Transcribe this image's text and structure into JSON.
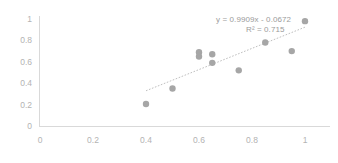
{
  "chart_data": {
    "type": "scatter",
    "title": "",
    "xlabel": "",
    "ylabel": "",
    "xlim": [
      0,
      1
    ],
    "ylim": [
      0,
      1
    ],
    "grid": false,
    "legend": false,
    "x_ticks": [
      "0",
      "0.2",
      "0.4",
      "0.6",
      "0.8",
      "1"
    ],
    "x_tick_values": [
      0,
      0.2,
      0.4,
      0.6,
      0.8,
      1
    ],
    "y_ticks": [
      "0",
      "0.2",
      "0.4",
      "0.6",
      "0.8",
      "1"
    ],
    "y_tick_values": [
      0,
      0.2,
      0.4,
      0.6,
      0.8,
      1
    ],
    "series": [
      {
        "name": "data",
        "marker": "circle",
        "color": "#a6a6a6",
        "points": [
          {
            "x": 0.4,
            "y": 0.205
          },
          {
            "x": 0.5,
            "y": 0.35
          },
          {
            "x": 0.6,
            "y": 0.69
          },
          {
            "x": 0.6,
            "y": 0.65
          },
          {
            "x": 0.65,
            "y": 0.67
          },
          {
            "x": 0.65,
            "y": 0.59
          },
          {
            "x": 0.75,
            "y": 0.52
          },
          {
            "x": 0.85,
            "y": 0.78
          },
          {
            "x": 0.95,
            "y": 0.7
          },
          {
            "x": 1.0,
            "y": 0.98
          }
        ]
      }
    ],
    "trendline": {
      "type": "linear",
      "slope": 0.9909,
      "intercept": -0.0672,
      "r_squared": 0.715,
      "color": "#bfbfbf",
      "style": "dotted",
      "x_start": 0.4,
      "x_end": 1.0
    },
    "annotations": {
      "equation": "y = 0.9909x - 0.0672",
      "r_squared_label": "R² = 0.715"
    }
  },
  "colors": {
    "marker": "#a6a6a6",
    "trendline": "#bfbfbf",
    "axis": "#d9d9d9",
    "tick_text": "#b3b3b3",
    "annotation_text": "#9b9b9b",
    "background": "#ffffff"
  }
}
